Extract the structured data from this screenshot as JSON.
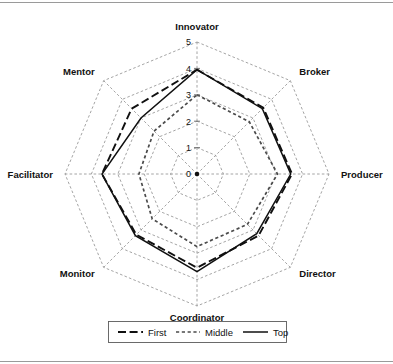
{
  "figure": {
    "background_color": "#ffffff",
    "frame_color": "#9a9a9a"
  },
  "chart_data": {
    "type": "radar",
    "title": "",
    "subtitle": "",
    "xlabel": "",
    "ylabel": "",
    "categories": [
      "Innovator",
      "Broker",
      "Producer",
      "Director",
      "Coordinator",
      "Monitor",
      "Facilitator",
      "Mentor"
    ],
    "tick_labels": [
      "0",
      "1",
      "2",
      "3",
      "4",
      "5"
    ],
    "ylim": [
      0,
      5
    ],
    "grid": true,
    "legend_position": "bottom",
    "series": [
      {
        "name": "First",
        "line_style": "dashed",
        "color": "#101010",
        "values": [
          3.95,
          3.55,
          3.6,
          3.3,
          3.55,
          3.25,
          3.6,
          3.5
        ]
      },
      {
        "name": "Middle",
        "line_style": "dotted",
        "color": "#4b4b4b",
        "values": [
          3.0,
          2.8,
          3.05,
          2.7,
          2.75,
          2.4,
          2.2,
          2.3
        ]
      },
      {
        "name": "Top",
        "line_style": "solid",
        "color": "#101010",
        "values": [
          3.95,
          3.5,
          3.55,
          3.2,
          3.7,
          3.3,
          3.6,
          3.0
        ]
      }
    ]
  },
  "legend": {
    "entries": [
      {
        "label": "First",
        "style": "dashed"
      },
      {
        "label": "Middle",
        "style": "dotted"
      },
      {
        "label": "Top",
        "style": "solid"
      }
    ]
  }
}
